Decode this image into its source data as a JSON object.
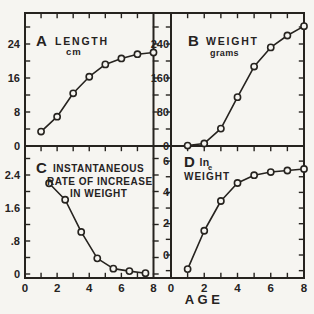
{
  "figure": {
    "x_axis_label": "AGE",
    "background_color": "#f6f5f1",
    "ink_color": "#26231f",
    "marker": "open-circle"
  },
  "x_tick_labels": [
    "0",
    "2",
    "4",
    "6",
    "8"
  ],
  "chart_data": [
    {
      "type": "line",
      "panel_letter": "A",
      "title": "LENGTH",
      "subtitle": "cm",
      "x": [
        1,
        2,
        3,
        4,
        5,
        6,
        7,
        8
      ],
      "values": [
        3.4,
        6.9,
        12.4,
        16.3,
        19.2,
        20.6,
        21.6,
        22.0
      ],
      "xlim": [
        0,
        8
      ],
      "ylim": [
        0,
        31
      ],
      "ytick_labels": [
        "0",
        "8",
        "16",
        "24"
      ],
      "ytick_values": [
        0,
        8,
        16,
        24
      ],
      "y_minor_step": 4,
      "legend": "none",
      "grid": false
    },
    {
      "type": "line",
      "panel_letter": "B",
      "title": "WEIGHT",
      "subtitle": "grams",
      "x": [
        1,
        2,
        3,
        4,
        5,
        6,
        7,
        8
      ],
      "values": [
        1,
        6,
        41,
        115,
        187,
        232,
        260,
        282
      ],
      "xlim": [
        0,
        8
      ],
      "ylim": [
        0,
        313
      ],
      "ytick_labels": [
        "0",
        "80",
        "160",
        "240"
      ],
      "ytick_values": [
        0,
        80,
        160,
        240
      ],
      "y_minor_step": 40,
      "legend": "none",
      "grid": false
    },
    {
      "type": "line",
      "panel_letter": "C",
      "title_lines": [
        "INSTANTANEOUS",
        "RATE OF INCREASE",
        "IN WEIGHT"
      ],
      "x": [
        1.5,
        2.5,
        3.5,
        4.5,
        5.5,
        6.5,
        7.5
      ],
      "values": [
        2.2,
        1.8,
        1.02,
        0.38,
        0.13,
        0.07,
        0.02
      ],
      "xlim": [
        0,
        8
      ],
      "ylim": [
        0,
        3.1
      ],
      "ytick_labels": [
        "0",
        ".8",
        "1.6",
        "2.4"
      ],
      "ytick_values": [
        0,
        0.8,
        1.6,
        2.4
      ],
      "y_minor_step": 0.4,
      "legend": "none",
      "grid": false
    },
    {
      "type": "line",
      "panel_letter": "D",
      "title": "ln",
      "title_subscript": "e",
      "title_line2": "WEIGHT",
      "x": [
        1,
        2,
        3,
        4,
        5,
        6,
        7,
        8
      ],
      "values": [
        -0.9,
        1.55,
        3.45,
        4.6,
        5.1,
        5.3,
        5.4,
        5.5
      ],
      "xlim": [
        0,
        8
      ],
      "ylim": [
        -1.5,
        7
      ],
      "ytick_labels": [
        "0",
        "2",
        "4",
        "6"
      ],
      "ytick_values": [
        0,
        2,
        4,
        6
      ],
      "y_minor_step": 1,
      "legend": "none",
      "grid": false
    }
  ]
}
